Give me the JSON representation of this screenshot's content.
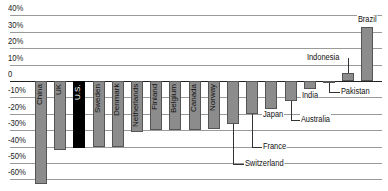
{
  "chart_data": {
    "type": "bar",
    "title": "",
    "xlabel": "",
    "ylabel": "",
    "ylim": [
      -60,
      40
    ],
    "y_ticks": [
      "40%",
      "30%",
      "20%",
      "10%",
      "0",
      "-10%",
      "-20%",
      "-30%",
      "-40%",
      "-50%",
      "-60%"
    ],
    "grid": true,
    "highlight": "U.S.",
    "categories": [
      "China",
      "UK",
      "U.S.",
      "Sweden",
      "Denmark",
      "Netherlands",
      "Finland",
      "Belgium",
      "Canada",
      "Norway",
      "Switzerland",
      "France",
      "Japan",
      "Australia",
      "India",
      "Pakistan",
      "Indonesia",
      "Brazil"
    ],
    "values": [
      -63,
      -42,
      -41,
      -40,
      -40,
      -31,
      -30,
      -30,
      -30,
      -29,
      -26,
      -20,
      -17,
      -12,
      -5,
      -1,
      5,
      33
    ],
    "colors": {
      "default": "#8c8c8c",
      "highlight": "#000000"
    }
  }
}
